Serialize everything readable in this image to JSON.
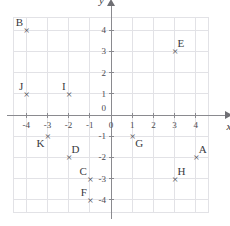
{
  "chart_data": {
    "type": "scatter",
    "title": "",
    "xlabel": "x",
    "ylabel": "y",
    "xlim": [
      -4.6,
      4.6
    ],
    "ylim": [
      -4.6,
      4.6
    ],
    "grid": true,
    "legend": "none",
    "x_ticks": [
      -4,
      -3,
      -2,
      -1,
      0,
      1,
      2,
      3,
      4
    ],
    "y_ticks": [
      -4,
      -3,
      -2,
      -1,
      0,
      1,
      2,
      3,
      4
    ],
    "x_tick_labels": [
      "-4",
      "-3",
      "-2",
      "-1",
      "0",
      "1",
      "2",
      "3",
      "4"
    ],
    "y_tick_labels": [
      "-4",
      "-3",
      "-2",
      "-1",
      "0",
      "1",
      "2",
      "3",
      "4"
    ],
    "origin_label": "0",
    "points": [
      {
        "label": "B",
        "x": -4,
        "y": 4,
        "label_pos": "upper-left"
      },
      {
        "label": "E",
        "x": 3,
        "y": 3,
        "label_pos": "upper-right"
      },
      {
        "label": "J",
        "x": -4,
        "y": 1,
        "label_pos": "upper-left"
      },
      {
        "label": "I",
        "x": -2,
        "y": 1,
        "label_pos": "upper-left"
      },
      {
        "label": "K",
        "x": -3,
        "y": -1,
        "label_pos": "lower-left"
      },
      {
        "label": "G",
        "x": 1,
        "y": -1,
        "label_pos": "lower-right"
      },
      {
        "label": "D",
        "x": -2,
        "y": -2,
        "label_pos": "upper-right"
      },
      {
        "label": "A",
        "x": 4,
        "y": -2,
        "label_pos": "upper-right"
      },
      {
        "label": "C",
        "x": -1,
        "y": -3,
        "label_pos": "upper-left"
      },
      {
        "label": "H",
        "x": 3,
        "y": -3,
        "label_pos": "upper-right"
      },
      {
        "label": "F",
        "x": -1,
        "y": -4,
        "label_pos": "upper-left"
      }
    ],
    "marker_glyph": "×",
    "colors": {
      "grid": "#e2e2e6",
      "axis": "#8a8a8f",
      "text": "#3a3a40",
      "marker": "#4a4a50",
      "background": "#ffffff"
    }
  }
}
